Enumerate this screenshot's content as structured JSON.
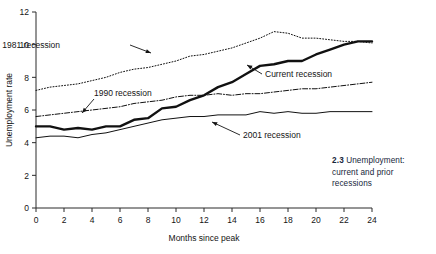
{
  "figure": {
    "caption_number": "2.3",
    "caption_text": "Unemployment: current and prior recessions"
  },
  "chart_data": {
    "type": "line",
    "title": "",
    "xlabel": "Months since peak",
    "ylabel": "Unemployment rate",
    "xlim": [
      0,
      24
    ],
    "ylim": [
      0,
      12
    ],
    "xticks": [
      0,
      2,
      4,
      6,
      8,
      10,
      12,
      14,
      16,
      18,
      20,
      22,
      24
    ],
    "yticks": [
      0,
      2,
      4,
      6,
      8,
      10,
      12
    ],
    "grid": false,
    "legend": "annotations-inline",
    "x": [
      0,
      1,
      2,
      3,
      4,
      5,
      6,
      7,
      8,
      9,
      10,
      11,
      12,
      13,
      14,
      15,
      16,
      17,
      18,
      19,
      20,
      21,
      22,
      23,
      24
    ],
    "series": [
      {
        "name": "1981 recession",
        "style": "dotted",
        "width": 1,
        "color": "#111111",
        "values": [
          7.2,
          7.4,
          7.5,
          7.6,
          7.8,
          8.0,
          8.3,
          8.5,
          8.6,
          8.8,
          9.0,
          9.3,
          9.4,
          9.6,
          9.8,
          10.1,
          10.4,
          10.8,
          10.7,
          10.4,
          10.4,
          10.3,
          10.2,
          10.2,
          10.1
        ]
      },
      {
        "name": "1990 recession",
        "style": "dash-dot",
        "width": 1,
        "color": "#111111",
        "values": [
          5.6,
          5.7,
          5.8,
          5.9,
          6.0,
          6.1,
          6.2,
          6.4,
          6.5,
          6.6,
          6.8,
          6.9,
          6.9,
          7.0,
          6.9,
          7.0,
          7.0,
          7.1,
          7.2,
          7.3,
          7.3,
          7.4,
          7.5,
          7.6,
          7.7
        ]
      },
      {
        "name": "Current recession",
        "style": "solid",
        "width": 2.4,
        "color": "#111111",
        "values": [
          5.0,
          5.0,
          4.8,
          4.9,
          4.8,
          5.0,
          5.0,
          5.4,
          5.5,
          6.1,
          6.2,
          6.6,
          6.9,
          7.4,
          7.7,
          8.2,
          8.7,
          8.8,
          9.0,
          9.0,
          9.4,
          9.7,
          10.0,
          10.2,
          10.2
        ]
      },
      {
        "name": "2001 recession",
        "style": "solid",
        "width": 1,
        "color": "#111111",
        "values": [
          4.3,
          4.4,
          4.4,
          4.3,
          4.5,
          4.6,
          4.8,
          5.0,
          5.2,
          5.4,
          5.5,
          5.6,
          5.6,
          5.7,
          5.7,
          5.7,
          5.9,
          5.8,
          5.9,
          5.8,
          5.8,
          5.9,
          5.9,
          5.9,
          5.9
        ]
      }
    ],
    "annotations": [
      {
        "text": "1981 recession",
        "label_x": 60,
        "label_y": 48,
        "arrow_from_x": 130,
        "arrow_from_y": 45,
        "arrow_to_x": 151,
        "arrow_to_y": 53
      },
      {
        "text": "1990 recession",
        "label_x": 94,
        "label_y": 96,
        "arrow_from_x": 94,
        "arrow_from_y": 99,
        "arrow_to_x": 82,
        "arrow_to_y": 113
      },
      {
        "text": "Current recession",
        "label_x": 265,
        "label_y": 77,
        "arrow_from_x": 262,
        "arrow_from_y": 74,
        "arrow_to_x": 247,
        "arrow_to_y": 65
      },
      {
        "text": "2001 recession",
        "label_x": 243,
        "label_y": 138,
        "arrow_from_x": 240,
        "arrow_from_y": 135,
        "arrow_to_x": 212,
        "arrow_to_y": 122
      }
    ]
  }
}
